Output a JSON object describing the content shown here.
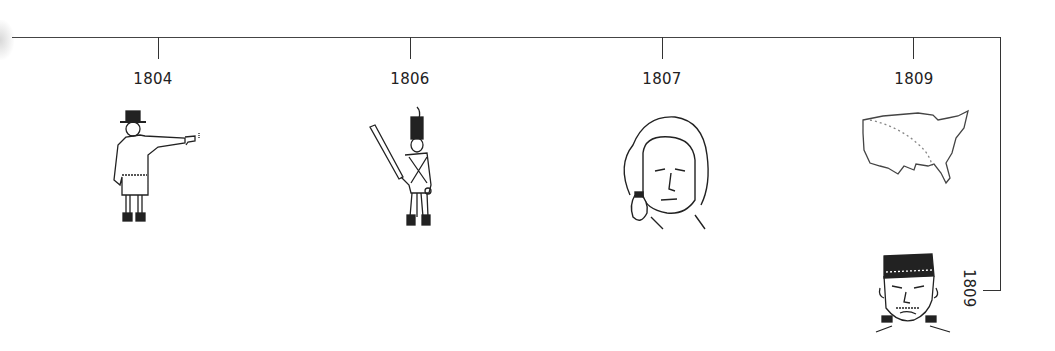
{
  "timeline": {
    "events": [
      {
        "year": "1804",
        "illustration": "duel-pistol-figure",
        "x": 158
      },
      {
        "year": "1806",
        "illustration": "soldier-with-rifle",
        "x": 410
      },
      {
        "year": "1807",
        "illustration": "powdered-wig-portrait",
        "x": 662
      },
      {
        "year": "1809",
        "illustration": "us-map-outline",
        "x": 913
      }
    ],
    "branch_event": {
      "year": "1809",
      "illustration": "frankenstein-monster-head",
      "orientation": "rotated-90"
    },
    "colors": {
      "line": "#333333",
      "text": "#222222",
      "background": "#ffffff"
    }
  }
}
